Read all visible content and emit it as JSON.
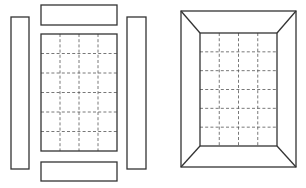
{
  "diagram": {
    "title": "",
    "colors": {
      "line": "#333333",
      "dash": "#555555",
      "background": "#ffffff"
    },
    "left_figure": {
      "description": "exploded frame: four separate strips around a gridded panel",
      "parts": [
        {
          "name": "left-strip",
          "x": 11,
          "y": 17,
          "w": 18,
          "h": 152
        },
        {
          "name": "top-strip",
          "x": 41,
          "y": 5,
          "w": 76,
          "h": 20
        },
        {
          "name": "right-strip",
          "x": 127,
          "y": 17,
          "w": 19,
          "h": 152
        },
        {
          "name": "bottom-strip",
          "x": 41,
          "y": 162,
          "w": 76,
          "h": 19
        }
      ],
      "panel": {
        "x": 41,
        "y": 34,
        "w": 76,
        "h": 117,
        "grid_cols": 4,
        "grid_rows": 6
      }
    },
    "right_figure": {
      "description": "assembled mitred frame around gridded panel",
      "outer": {
        "x": 181,
        "y": 11,
        "w": 115,
        "h": 156
      },
      "inner": {
        "x": 200,
        "y": 33,
        "w": 77,
        "h": 113,
        "grid_cols": 4,
        "grid_rows": 6
      }
    }
  }
}
